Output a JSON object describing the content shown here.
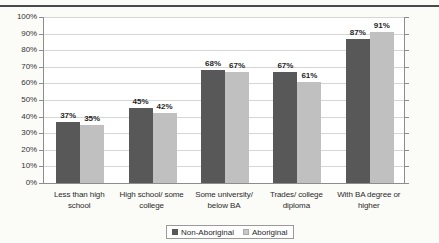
{
  "page": {
    "top_fragment": ""
  },
  "legend": {
    "position": "bottom-center",
    "entries": [
      {
        "label": "Non-Aboriginal",
        "color": "#585858",
        "swatch": "legend-swatch-non-aboriginal"
      },
      {
        "label": "Aboriginal",
        "color": "#c8c8c8",
        "swatch": "legend-swatch-aboriginal"
      }
    ]
  },
  "chart_data": {
    "type": "bar",
    "title": "",
    "xlabel": "",
    "ylabel": "",
    "ylim": [
      0,
      100
    ],
    "ytick_step": 10,
    "grid": true,
    "value_suffix": "%",
    "categories": [
      "Less than high school",
      "High school/ some college",
      "Some university/ below BA",
      "Trades/ college diploma",
      "With BA degree or higher"
    ],
    "category_lines": [
      [
        "Less than high",
        "school"
      ],
      [
        "High school/ some",
        "college"
      ],
      [
        "Some university/",
        "below BA"
      ],
      [
        "Trades/ college",
        "diploma"
      ],
      [
        "With BA degree or",
        "higher"
      ]
    ],
    "yticks": [
      "0%",
      "10%",
      "20%",
      "30%",
      "40%",
      "50%",
      "60%",
      "70%",
      "80%",
      "90%",
      "100%"
    ],
    "series": [
      {
        "name": "Non-Aboriginal",
        "color": "#585858",
        "values": [
          37,
          45,
          68,
          67,
          87
        ],
        "labels": [
          "37%",
          "45%",
          "68%",
          "67%",
          "87%"
        ]
      },
      {
        "name": "Aboriginal",
        "color": "#c0c0c0",
        "values": [
          35,
          42,
          67,
          61,
          91
        ],
        "labels": [
          "35%",
          "42%",
          "67%",
          "61%",
          "91%"
        ]
      }
    ]
  }
}
